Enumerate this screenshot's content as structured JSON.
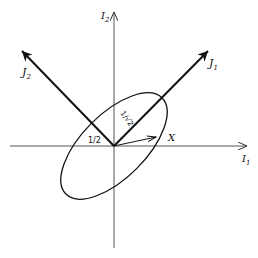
{
  "diagram": {
    "axes": {
      "horizontal_label": "I",
      "horizontal_sub": "1",
      "vertical_label": "I",
      "vertical_sub": "2"
    },
    "principal_axes": {
      "j1_label": "J",
      "j1_sub": "1",
      "j2_label": "J",
      "j2_sub": "2"
    },
    "annotations": {
      "half_label": "1/2",
      "inv_sqrt2_label": "1/√2",
      "vector_label": "X"
    },
    "colors": {
      "stroke": "#111111",
      "axis": "#555555",
      "background": "#ffffff"
    }
  }
}
